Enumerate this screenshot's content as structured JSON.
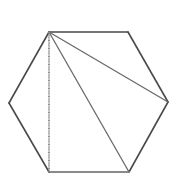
{
  "diagram": {
    "type": "geometry",
    "shape": "regular-hexagon",
    "colors": {
      "background": "#ffffff",
      "edge": "#4a4a4a",
      "diagonal": "#6a6a6a",
      "dotted": "#8a8a8a"
    },
    "vertices": [
      {
        "id": "A",
        "x": 49,
        "y": 32
      },
      {
        "id": "B",
        "x": 128,
        "y": 32
      },
      {
        "id": "C",
        "x": 168,
        "y": 102
      },
      {
        "id": "D",
        "x": 129,
        "y": 172
      },
      {
        "id": "E",
        "x": 49,
        "y": 172
      },
      {
        "id": "F",
        "x": 9,
        "y": 103
      }
    ],
    "diagonals": [
      {
        "from": "A",
        "to": "C"
      },
      {
        "from": "A",
        "to": "D"
      },
      {
        "from": "A",
        "to": "E",
        "style": "dotted"
      }
    ],
    "labels": []
  }
}
